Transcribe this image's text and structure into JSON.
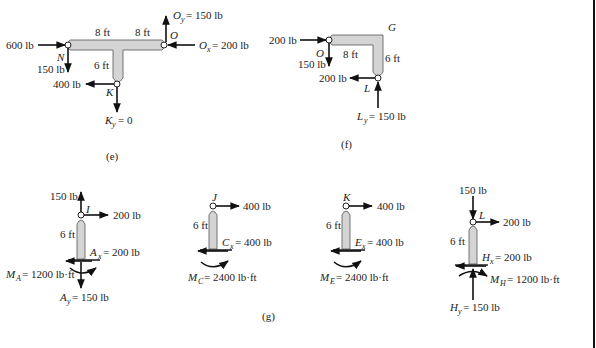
{
  "figures": {
    "e": {
      "caption": "(e)",
      "dims": {
        "left": "8 ft",
        "right": "8 ft",
        "stem": "6 ft"
      },
      "points": {
        "N": "N",
        "O": "O",
        "K": "K"
      },
      "forces": {
        "n_horizontal": "600 lb",
        "n_vertical": "150 lb",
        "k_horizontal": "400 lb",
        "oy": "= 150 lb",
        "oy_sym": "O",
        "oy_sub": "y",
        "ox": "= 200 lb",
        "ox_sym": "O",
        "ox_sub": "x",
        "ky": "= 0",
        "ky_sym": "K",
        "ky_sub": "y"
      }
    },
    "f": {
      "caption": "(f)",
      "dims": {
        "top": "8 ft",
        "side": "6 ft"
      },
      "points": {
        "O": "O",
        "G": "G",
        "L": "L"
      },
      "forces": {
        "o_horizontal": "200 lb",
        "o_vertical": "150 lb",
        "l_horizontal": "200 lb",
        "ly": "= 150 lb",
        "ly_sym": "L",
        "ly_sub": "y"
      }
    },
    "g": {
      "caption": "(g)",
      "columns": [
        {
          "top_point": "I",
          "height": "6 ft",
          "top_vertical": "150 lb",
          "top_horizontal": "200 lb",
          "base_x_sym": "A",
          "base_x_sub": "x",
          "base_x": "= 200 lb",
          "moment_sym": "M",
          "moment_sub": "A",
          "moment": "= 1200 lb·ft",
          "base_y_sym": "A",
          "base_y_sub": "y",
          "base_y": "= 150 lb"
        },
        {
          "top_point": "J",
          "height": "6 ft",
          "top_horizontal": "400 lb",
          "base_x_sym": "C",
          "base_x_sub": "x",
          "base_x": "= 400 lb",
          "moment_sym": "M",
          "moment_sub": "C",
          "moment": "= 2400 lb·ft"
        },
        {
          "top_point": "K",
          "height": "6 ft",
          "top_horizontal": "400 lb",
          "base_x_sym": "E",
          "base_x_sub": "x",
          "base_x": "= 400 lb",
          "moment_sym": "M",
          "moment_sub": "E",
          "moment": "= 2400 lb·ft"
        },
        {
          "top_point": "L",
          "height": "6 ft",
          "top_vertical": "150 lb",
          "top_horizontal": "200 lb",
          "base_x_sym": "H",
          "base_x_sub": "x",
          "base_x": "= 200 lb",
          "moment_sym": "M",
          "moment_sub": "H",
          "moment": "= 1200 lb·ft",
          "base_y_sym": "H",
          "base_y_sub": "y",
          "base_y": "= 150 lb"
        }
      ]
    }
  },
  "colors": {
    "member_fill": "#d4d4d4",
    "ink": "#111111"
  }
}
